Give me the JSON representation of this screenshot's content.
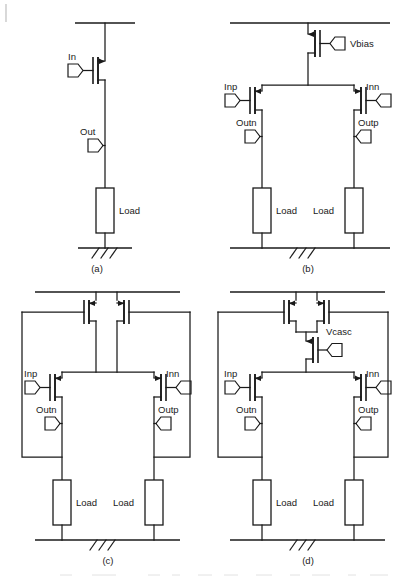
{
  "figure": {
    "ink_color": "#1a1a1a",
    "background": "#ffffff"
  },
  "panels": [
    {
      "id": "a",
      "caption": "(a)",
      "description": "single-ended common-source stage with resistive load",
      "labels": {
        "input": "In",
        "output": "Out",
        "load_left": "Load"
      }
    },
    {
      "id": "b",
      "caption": "(b)",
      "description": "differential pair with tail current source biased by Vbias",
      "labels": {
        "bias": "Vbias",
        "input_p": "Inp",
        "input_n": "Inn",
        "output_n": "Outn",
        "output_p": "Outp",
        "load_left": "Load",
        "load_right": "Load"
      }
    },
    {
      "id": "c",
      "caption": "(c)",
      "description": "differential pair with cross-coupled positive feedback pair",
      "labels": {
        "input_p": "Inp",
        "input_n": "Inn",
        "output_n": "Outn",
        "output_p": "Outp",
        "load_left": "Load",
        "load_right": "Load"
      }
    },
    {
      "id": "d",
      "caption": "(d)",
      "description": "differential pair with cross-coupled pair and cascode device Vcasc",
      "labels": {
        "cascode": "Vcasc",
        "input_p": "Inp",
        "input_n": "Inn",
        "output_n": "Outn",
        "output_p": "Outp",
        "load_left": "Load",
        "load_right": "Load"
      }
    }
  ]
}
